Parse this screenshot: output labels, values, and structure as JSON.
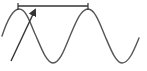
{
  "diagram": {
    "type": "wave",
    "wave": {
      "color": "#555555",
      "cycles_visible": 2,
      "crests_x": [
        19,
        88
      ],
      "troughs_x": [
        53,
        122
      ],
      "crest_y": 9,
      "trough_y": 63
    },
    "span_marker": {
      "color": "#333333",
      "x_start": 18,
      "x_end": 88,
      "y": 6,
      "meaning": "wavelength"
    },
    "arrow": {
      "color": "#333333",
      "from": [
        11,
        61
      ],
      "to": [
        35,
        9
      ]
    }
  }
}
